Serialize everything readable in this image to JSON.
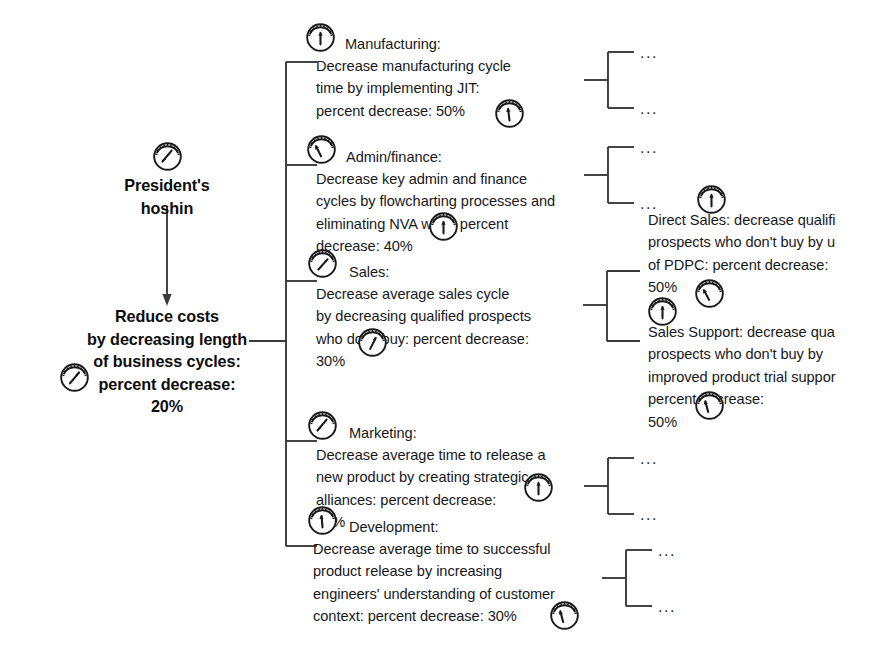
{
  "diagram": {
    "root": {
      "label": "President's\nhoshin",
      "icon": "gauge-icon"
    },
    "objective": {
      "label": "Reduce costs\nby decreasing length\nof business cycles:\npercent decrease:\n20%",
      "icon": "gauge-icon"
    },
    "branches": [
      {
        "id": "manufacturing",
        "heading": "Manufacturing:",
        "body": "Decrease manufacturing cycle\ntime by implementing JIT:\npercent decrease: 50%",
        "icon": "gauge-icon",
        "children": [
          "...",
          "..."
        ]
      },
      {
        "id": "admin-finance",
        "heading": "Admin/finance:",
        "body": "Decrease key admin and finance\ncycles by flowcharting processes and\neliminating NVA work: percent\ndecrease: 40%",
        "icon": "gauge-icon",
        "children": [
          "...",
          "..."
        ]
      },
      {
        "id": "sales",
        "heading": "Sales:",
        "body": "Decrease average sales cycle\nby decreasing qualified prospects\nwho don't buy: percent decrease:\n30%",
        "icon": "gauge-icon",
        "children": [
          {
            "id": "direct-sales",
            "text": "Direct Sales: decrease qualifi\nprospects who don't buy by u\nof PDPC: percent decrease:\n50%",
            "icon": "gauge-icon"
          },
          {
            "id": "sales-support",
            "text": "Sales Support: decrease qua\nprospects who don't buy by\nimproved product trial suppor\npercent decrease:\n50%",
            "icon": "gauge-icon"
          }
        ]
      },
      {
        "id": "marketing",
        "heading": "Marketing:",
        "body": "Decrease average time to release a\nnew product by creating strategic\nalliances: percent decrease:\n50%",
        "icon": "gauge-icon",
        "children": [
          "...",
          "..."
        ]
      },
      {
        "id": "development",
        "heading": "Development:",
        "body": "Decrease average time to successful\nproduct release by increasing\nengineers' understanding of customer\ncontext: percent decrease: 30%",
        "icon": "gauge-icon",
        "children": [
          "...",
          "..."
        ]
      }
    ],
    "colors": {
      "line": "#3a3a3a",
      "text": "#17181a",
      "background": "#ffffff"
    }
  }
}
